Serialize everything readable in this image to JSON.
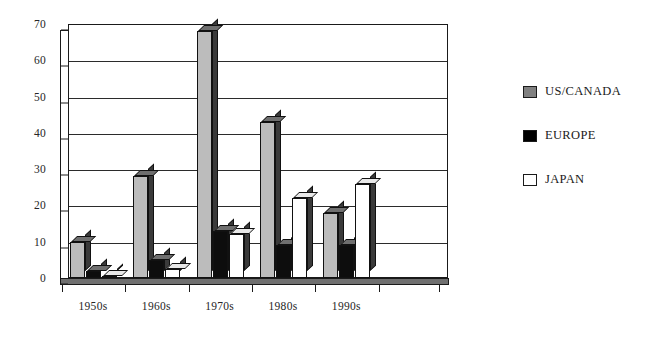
{
  "chart_data": {
    "type": "bar",
    "title": "",
    "subtitle": "",
    "xlabel": "",
    "ylabel": "",
    "categories": [
      "1950s",
      "1960s",
      "1970s",
      "1980s",
      "1990s"
    ],
    "series": [
      {
        "name": "US/CANADA",
        "color": "#808080",
        "values": [
          10,
          28,
          68,
          43,
          18
        ]
      },
      {
        "name": "EUROPE",
        "color": "#000000",
        "values": [
          2,
          5,
          13,
          9,
          9
        ]
      },
      {
        "name": "JAPAN",
        "color": "#ffffff",
        "values": [
          0.5,
          2.5,
          12,
          22,
          26
        ]
      }
    ],
    "ylim": [
      0,
      70
    ],
    "yticks": [
      0,
      10,
      20,
      30,
      40,
      50,
      60,
      70
    ],
    "ytick_labels": [
      "0",
      "10",
      "20",
      "30",
      "40",
      "50",
      "60",
      "70"
    ],
    "grid": true,
    "grid_axis": "y",
    "legend_position": "right",
    "style": "3d-column",
    "background": "#ffffff"
  },
  "legend": {
    "items": [
      {
        "label": "US/CANADA",
        "swatch": "gray-swatch-icon"
      },
      {
        "label": "EUROPE",
        "swatch": "black-swatch-icon"
      },
      {
        "label": "JAPAN",
        "swatch": "white-swatch-icon"
      }
    ]
  }
}
